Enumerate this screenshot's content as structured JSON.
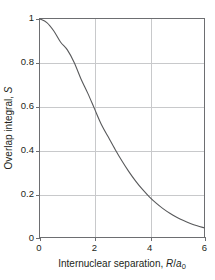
{
  "chart_data": {
    "type": "line",
    "title": "",
    "xlabel": "Internuclear separation, R/a₀",
    "ylabel": "Overlap integral, S",
    "xlabel_parts": {
      "prefix": "Internuclear separation, ",
      "r": "R",
      "slash": "/",
      "a": "a",
      "zero": "0"
    },
    "ylabel_parts": {
      "prefix": "Overlap integral, ",
      "s": "S"
    },
    "xlim": [
      0,
      6
    ],
    "ylim": [
      0,
      1
    ],
    "xticks": [
      "0",
      "2",
      "4",
      "6"
    ],
    "xtick_values": [
      0,
      2,
      4,
      6
    ],
    "yticks": [
      "0",
      "0.2",
      "0.4",
      "0.6",
      "0.8",
      "1"
    ],
    "ytick_values": [
      0,
      0.2,
      0.4,
      0.6,
      0.8,
      1
    ],
    "grid": true,
    "grid_color": "#c8c9cb",
    "legend": "none",
    "line_color": "#58595b",
    "line_width": 1.1,
    "frame_color": "#6d6e71",
    "background": "#ffffff",
    "equation": "S(R) = e^(-R) * (1 + R + R^2/3)",
    "x": [
      0,
      0.2,
      0.4,
      0.6,
      0.8,
      1.0,
      1.2,
      1.4,
      1.6,
      1.8,
      2.0,
      2.2,
      2.4,
      2.6,
      2.8,
      3.0,
      3.2,
      3.4,
      3.6,
      3.8,
      4.0,
      4.2,
      4.4,
      4.6,
      4.8,
      5.0,
      5.2,
      5.4,
      5.6,
      5.8,
      6.0
    ],
    "y": [
      1.0,
      0.9894,
      0.9651,
      0.9312,
      0.891,
      0.8473,
      0.8022,
      0.7572,
      0.7133,
      0.6711,
      0.5865,
      0.5865,
      0.5512,
      0.518,
      0.4867,
      0.4232,
      0.4232,
      0.397,
      0.3724,
      0.3494,
      0.3084,
      0.3084,
      0.2893,
      0.2714,
      0.2545,
      0.2241,
      0.2241,
      0.2103,
      0.1973,
      0.1851,
      0.1626
    ]
  },
  "figure": {
    "series_points": [
      {
        "x": 0.0,
        "y": 1.0
      },
      {
        "x": 0.25,
        "y": 0.9837
      },
      {
        "x": 0.5,
        "y": 0.9462
      },
      {
        "x": 0.75,
        "y": 0.8945
      },
      {
        "x": 1.0,
        "y": 0.8584
      },
      {
        "x": 1.25,
        "y": 0.8009
      },
      {
        "x": 1.5,
        "y": 0.7252
      },
      {
        "x": 1.75,
        "y": 0.6589
      },
      {
        "x": 2.0,
        "y": 0.5865
      },
      {
        "x": 2.25,
        "y": 0.515
      },
      {
        "x": 2.5,
        "y": 0.4583
      },
      {
        "x": 2.75,
        "y": 0.4016
      },
      {
        "x": 3.0,
        "y": 0.3485
      },
      {
        "x": 3.25,
        "y": 0.3
      },
      {
        "x": 3.5,
        "y": 0.2565
      },
      {
        "x": 3.75,
        "y": 0.2181
      },
      {
        "x": 4.0,
        "y": 0.1845
      },
      {
        "x": 4.25,
        "y": 0.1554
      },
      {
        "x": 4.5,
        "y": 0.1303
      },
      {
        "x": 4.75,
        "y": 0.1089
      },
      {
        "x": 5.0,
        "y": 0.0907
      },
      {
        "x": 5.25,
        "y": 0.0753
      },
      {
        "x": 5.5,
        "y": 0.0624
      },
      {
        "x": 5.75,
        "y": 0.0515
      },
      {
        "x": 6.0,
        "y": 0.0425
      }
    ]
  }
}
